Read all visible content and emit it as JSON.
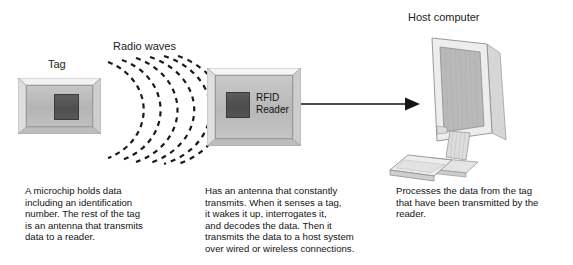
{
  "diagram": {
    "background": "#ffffff",
    "ink": "#1a1a1a"
  },
  "labels": {
    "tag": "Tag",
    "radio_waves": "Radio waves",
    "host_computer": "Host computer",
    "reader_line1": "RFID",
    "reader_line2": "Reader"
  },
  "captions": {
    "tag": [
      "A microchip holds data",
      "including an identification",
      "number. The rest of the tag",
      "is an antenna that transmits",
      "data to a reader."
    ],
    "reader": [
      "Has an antenna that constantly",
      "transmits. When it senses a tag,",
      "it wakes it up, interrogates it,",
      "and decodes the data. Then it",
      "transmits the data to a host system",
      "over wired or wireless connections."
    ],
    "host": [
      "Processes the data from the tag",
      "that have been transmitted by the",
      "reader."
    ]
  },
  "graphics": {
    "wave_arc_count": 6,
    "wave_style": "dashed",
    "wave_color": "#1a1a1a",
    "arrow_direction": "right",
    "arrow_color": "#151515",
    "tag_chip_color": "#4f4f4f",
    "reader_chip_color": "#4c4c4c",
    "device_body_color": "#c0c0c0",
    "monitor_screen_color": "#b9b9b9",
    "monitor_bezel_color": "#ededed"
  }
}
